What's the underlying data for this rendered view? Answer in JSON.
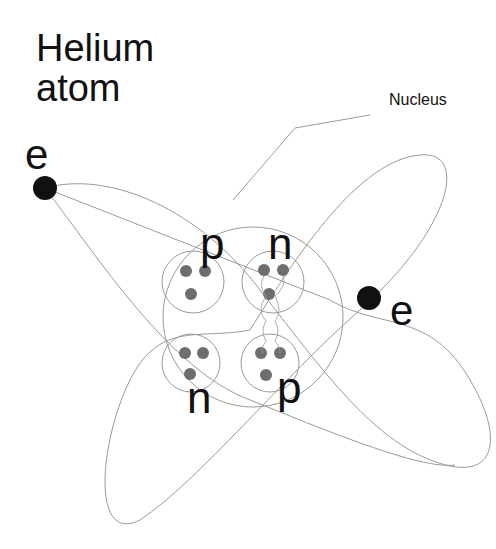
{
  "title": [
    "Helium",
    "atom"
  ],
  "nucleus_label": "Nucleus",
  "electron_label": "e",
  "particles": {
    "proton": "p",
    "neutron": "n"
  },
  "colors": {
    "line": "#999999",
    "electron": "#111111",
    "quark": "#6e6e6e",
    "text": "#111111"
  }
}
